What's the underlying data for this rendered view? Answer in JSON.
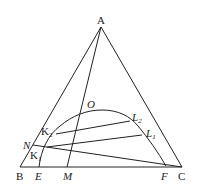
{
  "diagram": {
    "type": "ternary-phase-diagram",
    "line_color": "#222222",
    "background": "#ffffff",
    "vertices": {
      "A": {
        "label": "A",
        "x": 101,
        "y": 27
      },
      "B": {
        "label": "B",
        "x": 20,
        "y": 167
      },
      "C": {
        "label": "C",
        "x": 182,
        "y": 167
      }
    },
    "points": {
      "E": {
        "label": "E",
        "x": 39,
        "y": 167
      },
      "M": {
        "label": "M",
        "x": 67,
        "y": 167
      },
      "F": {
        "label": "F",
        "x": 166,
        "y": 166
      },
      "N": {
        "label": "N",
        "x": 33,
        "y": 145
      },
      "O": {
        "label": "O",
        "x": 82,
        "y": 113
      },
      "K1": {
        "label": "K",
        "sub": "1",
        "x": 47,
        "y": 147
      },
      "K2": {
        "label": "K",
        "sub": "2",
        "x": 56,
        "y": 134
      },
      "L1": {
        "label": "L",
        "sub": "1",
        "x": 142,
        "y": 135
      },
      "L2": {
        "label": "L",
        "sub": "2",
        "x": 130,
        "y": 121
      }
    },
    "lines": [
      {
        "name": "side-AB",
        "from": "A",
        "to": "B"
      },
      {
        "name": "side-AC",
        "from": "A",
        "to": "C"
      },
      {
        "name": "side-BC",
        "from": "B",
        "to": "C"
      },
      {
        "name": "line-AM",
        "from": "A",
        "to": "M"
      },
      {
        "name": "line-NC",
        "from": "N",
        "to": "C"
      },
      {
        "name": "tie-line-K1L1",
        "from": "K1",
        "to": "L1"
      },
      {
        "name": "tie-line-K2L2",
        "from": "K2",
        "to": "L2"
      }
    ],
    "curve": {
      "name": "binodal-curve",
      "through": [
        "E",
        "K1",
        "K2",
        "O",
        "L2",
        "L1",
        "F"
      ]
    }
  }
}
